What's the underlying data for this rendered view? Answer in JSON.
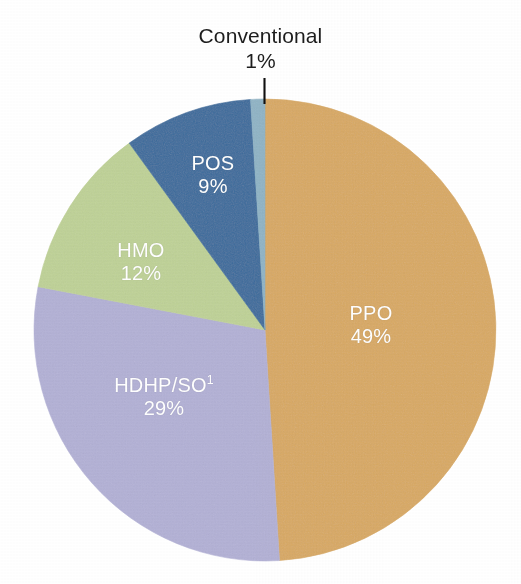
{
  "chart_data": {
    "type": "pie",
    "title": "",
    "subtitle": "",
    "xlabel": "",
    "ylabel": "",
    "legend_position": "none",
    "grid": false,
    "labels_inside_slices": true,
    "start_angle_deg": 0,
    "direction": "clockwise",
    "unit": "%",
    "categories": [
      "PPO",
      "HDHP/SO",
      "HMO",
      "POS",
      "Conventional"
    ],
    "values": [
      49,
      29,
      12,
      9,
      1
    ],
    "colors": [
      "#d9a962",
      "#b3b1d6",
      "#bfd296",
      "#3a6b9c",
      "#8fb4c6"
    ],
    "slices": [
      {
        "name": "PPO",
        "label": "PPO",
        "value": 49,
        "value_label": "49%",
        "color": "#d9a962",
        "label_color": "#ffffff",
        "label_placement": "inside",
        "footnote_marker": "",
        "start_angle_deg": 0,
        "sweep_deg": 176.4
      },
      {
        "name": "HDHP/SO",
        "label": "HDHP/SO",
        "value": 29,
        "value_label": "29%",
        "color": "#b3b1d6",
        "label_color": "#ffffff",
        "label_placement": "inside",
        "footnote_marker": "1",
        "start_angle_deg": 176.4,
        "sweep_deg": 104.4
      },
      {
        "name": "HMO",
        "label": "HMO",
        "value": 12,
        "value_label": "12%",
        "color": "#bfd296",
        "label_color": "#ffffff",
        "label_placement": "inside",
        "footnote_marker": "",
        "start_angle_deg": 280.8,
        "sweep_deg": 43.2
      },
      {
        "name": "POS",
        "label": "POS",
        "value": 9,
        "value_label": "9%",
        "color": "#3a6b9c",
        "label_color": "#ffffff",
        "label_placement": "inside",
        "footnote_marker": "",
        "start_angle_deg": 324.0,
        "sweep_deg": 32.4
      },
      {
        "name": "Conventional",
        "label": "Conventional",
        "value": 1,
        "value_label": "1%",
        "color": "#8fb4c6",
        "label_color": "#1d1d1d",
        "label_placement": "outside-callout",
        "footnote_marker": "",
        "start_angle_deg": 356.4,
        "sweep_deg": 3.6
      }
    ]
  },
  "callout": {
    "name": "Conventional",
    "value_label": "1%",
    "leader_line_color": "#101010"
  },
  "geometry": {
    "center_x": 265,
    "center_y": 330,
    "radius": 231,
    "canvas_width": 521,
    "canvas_height": 584
  },
  "theme": {
    "background": "#ffffff",
    "text_dark": "#1d1d1d",
    "text_light": "#ffffff"
  }
}
